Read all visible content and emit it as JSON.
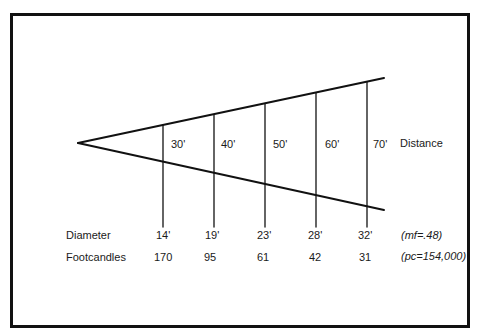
{
  "diagram": {
    "title": "",
    "row_labels": {
      "distance": "Distance",
      "diameter": "Diameter",
      "footcandles": "Footcandles"
    },
    "notes": {
      "mf": "(mf=.48)",
      "pc": "(pc=154,000)"
    },
    "columns": [
      {
        "distance": "30'",
        "diameter": "14'",
        "footcandles": "170"
      },
      {
        "distance": "40'",
        "diameter": "19'",
        "footcandles": "95"
      },
      {
        "distance": "50'",
        "diameter": "23'",
        "footcandles": "61"
      },
      {
        "distance": "60'",
        "diameter": "28'",
        "footcandles": "42"
      },
      {
        "distance": "70'",
        "diameter": "32'",
        "footcandles": "31"
      }
    ],
    "colors": {
      "line": "#111111",
      "text": "#1a1a1a",
      "background": "#ffffff"
    }
  }
}
